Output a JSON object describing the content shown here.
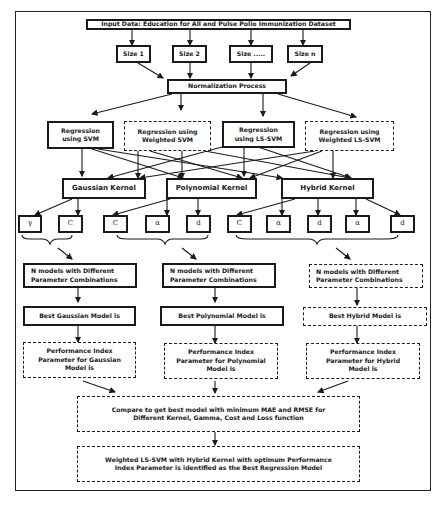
{
  "diagram": {
    "input": "Input Data: Education for All and Pulse Polio Immunization Dataset",
    "sizes": [
      "Size 1",
      "Size 2",
      "Size .....",
      "Size n"
    ],
    "normalization": "Normalization Process",
    "regressions": [
      {
        "label": "Regression\nusing SVM",
        "style": "solid"
      },
      {
        "label": "Regression using\nWeighted SVM",
        "style": "dashed"
      },
      {
        "label": "Regression\nusing LS-SVM",
        "style": "solid"
      },
      {
        "label": "Regression using\nWeighted LS-SVM",
        "style": "dashed"
      }
    ],
    "kernels": [
      "Gaussian Kernel",
      "Polynomial Kernel",
      "Hybrid Kernel"
    ],
    "parameters": {
      "gaussian": [
        "γ",
        "C"
      ],
      "polynomial": [
        "C",
        "α",
        "d"
      ],
      "hybrid": [
        "C",
        "α",
        "d",
        "α",
        "d"
      ]
    },
    "n_models": [
      {
        "label": "N models with Different\nParameter Combinations",
        "style": "solid"
      },
      {
        "label": "N models with Different\nParameter Combinations",
        "style": "solid"
      },
      {
        "label": "N models with Different\nParameter Combinations",
        "style": "dashed"
      }
    ],
    "best_models": [
      {
        "label": "Best Gaussian Model is",
        "style": "solid"
      },
      {
        "label": "Best Polynomial Model is",
        "style": "solid"
      },
      {
        "label": "Best Hybrid Model is",
        "style": "dashed"
      }
    ],
    "performance": [
      "Performance Index\nParameter for Gaussian\nModel is",
      "Performance Index\nParameter for Polynomial\nModel is",
      "Performance Index\nParameter for Hybrid\nModel is"
    ],
    "compare": "Compare to get best model with minimum MAE and RMSE for\nDifferent Kernel, Gamma, Cost and Loss function",
    "result": "Weighted LS-SVM with Hybrid Kernel with optimum Performance\nIndex Parameter is identified as the Best Regression Model"
  }
}
